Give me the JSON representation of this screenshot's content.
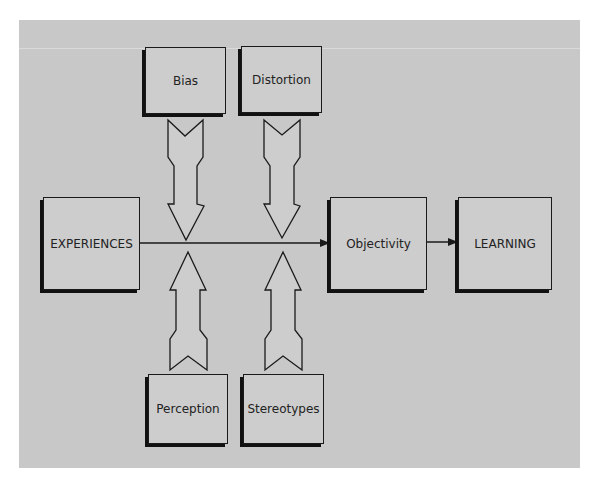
{
  "diagram": {
    "nodes": {
      "bias": "Bias",
      "distortion": "Distortion",
      "experiences": "EXPERIENCES",
      "objectivity": "Objectivity",
      "learning": "LEARNING",
      "perception": "Perception",
      "stereotypes": "Stereotypes"
    },
    "edges": [
      {
        "from": "EXPERIENCES",
        "to": "Objectivity"
      },
      {
        "from": "Objectivity",
        "to": "LEARNING"
      },
      {
        "from": "Bias",
        "to": "EXPERIENCES→Objectivity line",
        "direction": "down"
      },
      {
        "from": "Distortion",
        "to": "EXPERIENCES→Objectivity line",
        "direction": "down"
      },
      {
        "from": "Perception",
        "to": "EXPERIENCES→Objectivity line",
        "direction": "up"
      },
      {
        "from": "Stereotypes",
        "to": "EXPERIENCES→Objectivity line",
        "direction": "up"
      }
    ],
    "colors": {
      "background": "#c8c8c8",
      "box": "#cdcdcd",
      "stroke": "#1a1a1a"
    }
  }
}
